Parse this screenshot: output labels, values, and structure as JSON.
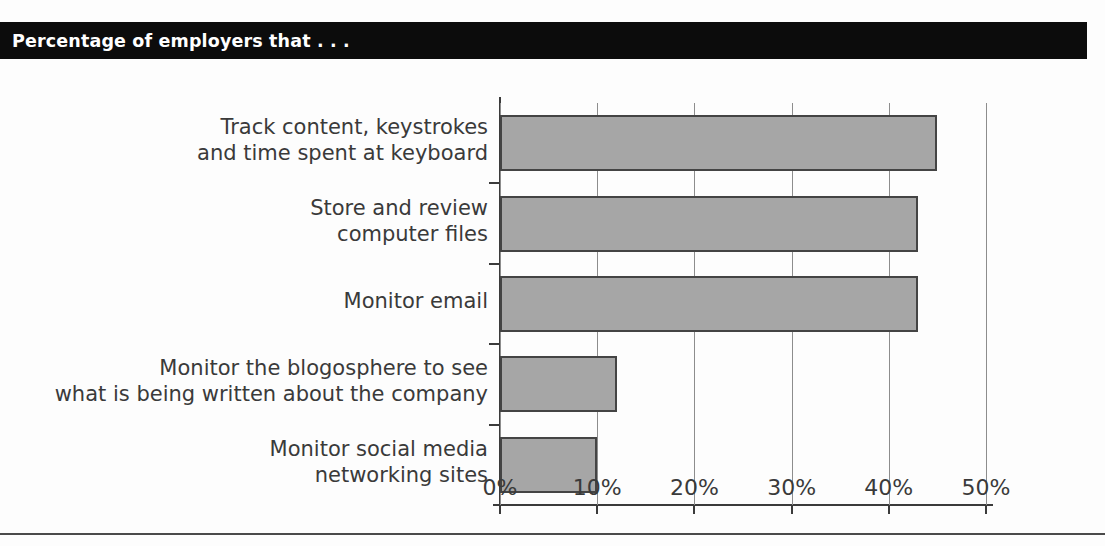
{
  "banner": {
    "title": "Percentage of employers that . . .",
    "background_color": "#0c0c0c",
    "text_color": "#ffffff"
  },
  "chart_data": {
    "type": "bar",
    "orientation": "horizontal",
    "title": "Percentage of employers that . . .",
    "categories": [
      "Track content, keystrokes\nand time spent at keyboard",
      "Store and review\ncomputer files",
      "Monitor email",
      "Monitor the blogosphere to see\nwhat is being written about the company",
      "Monitor social media\nnetworking sites"
    ],
    "values": [
      45,
      43,
      43,
      12,
      10
    ],
    "value_labels": [
      "45%",
      "43%",
      "43%",
      "12%",
      "10%"
    ],
    "xlabel": "",
    "ylabel": "",
    "xlim": [
      0,
      50
    ],
    "xticks": [
      0,
      10,
      20,
      30,
      40,
      50
    ],
    "xtick_labels": [
      "0%",
      "10%",
      "20%",
      "30%",
      "40%",
      "50%"
    ],
    "grid": "vertical",
    "legend": "none",
    "bar_fill_color": "#a6a6a6",
    "bar_border_color": "#444444",
    "axis_color": "#3b3b3b",
    "gridline_color": "#8d8d8d",
    "label_color": "#3a3a3a"
  }
}
